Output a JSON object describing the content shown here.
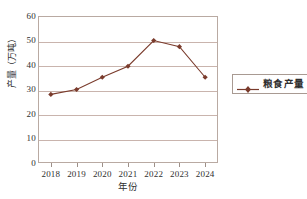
{
  "chart_data": {
    "type": "line",
    "title": "",
    "xlabel": "年份",
    "ylabel": "产量（万吨）",
    "categories": [
      "2018",
      "2019",
      "2020",
      "2021",
      "2022",
      "2023",
      "2024"
    ],
    "series": [
      {
        "name": "粮食产量",
        "values": [
          28,
          30,
          35,
          39.5,
          50,
          47.5,
          35
        ],
        "color": "#7a3b2c",
        "marker": "diamond"
      }
    ],
    "ylim": [
      0,
      60
    ],
    "yticks": [
      0,
      10,
      20,
      30,
      40,
      50,
      60
    ],
    "ytick_labels": [
      "0",
      "10",
      "20",
      "30",
      "40",
      "50",
      "60"
    ],
    "grid": "horizontal",
    "legend_position": "right",
    "colors": {
      "series": "#7a3b2c",
      "gridline": "#c9b4ad",
      "frame": "#b9aaa2",
      "text": "#2f2f2f",
      "background": "#ffffff"
    }
  },
  "legend": {
    "entries": [
      {
        "label": "粮食产量",
        "marker_icon": "diamond-marker-icon"
      }
    ]
  },
  "axes": {
    "y_title": "产量（万吨）",
    "x_title": "年份"
  }
}
